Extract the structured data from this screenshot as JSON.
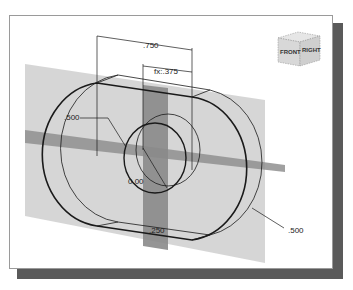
{
  "diagram": {
    "type": "cad-sketch-3d-view",
    "dimensions": {
      "overall_width": ".750",
      "offset": "fx:.375",
      "left_radius": ".500",
      "right_radius": ".500",
      "origin": "0.00",
      "thickness": ".250"
    },
    "view_cube": {
      "front_label": "FRONT",
      "right_label": "RIGHT"
    },
    "colors": {
      "plane": "#c8c8c8",
      "plane_dark": "#8a8a8a",
      "sketch_line": "#1a1a1a",
      "shadow": "#5a5a5a"
    }
  }
}
